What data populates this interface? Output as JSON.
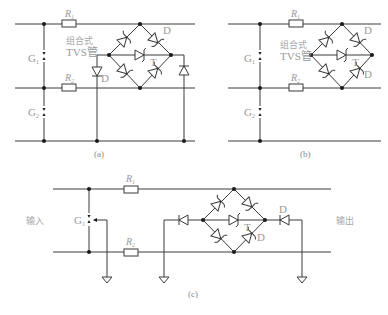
{
  "figure": {
    "panels": [
      {
        "id": "a",
        "caption": "(a)",
        "labels": {
          "r1": "R",
          "r1_sub": "1",
          "r2": "R",
          "r2_sub": "2",
          "g1": "G",
          "g1_sub": "1",
          "g2": "G",
          "g2_sub": "2",
          "tvs_line1": "组合式",
          "tvs_line2": "TVS管",
          "d_top": "D",
          "t": "T",
          "d_left": "D"
        }
      },
      {
        "id": "b",
        "caption": "(b)",
        "labels": {
          "r1": "R",
          "r1_sub": "1",
          "r2": "R",
          "r2_sub": "2",
          "g1": "G",
          "g1_sub": "1",
          "g2": "G",
          "g2_sub": "2",
          "tvs_line1": "组合式",
          "tvs_line2": "TVS管",
          "d_top": "D",
          "t": "T",
          "d_bottom": "D"
        }
      },
      {
        "id": "c",
        "caption": "(c)",
        "labels": {
          "r1": "R",
          "r1_sub": "1",
          "r2": "R",
          "r2_sub": "2",
          "g1": "G",
          "g1_sub": "1",
          "input": "输入",
          "output": "输出",
          "d_out": "D",
          "t": "T",
          "d_bottom": "D"
        }
      }
    ]
  }
}
